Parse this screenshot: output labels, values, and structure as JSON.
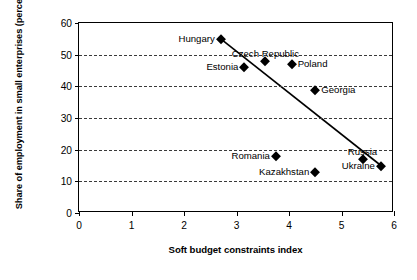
{
  "chart_data": {
    "type": "scatter",
    "title": "",
    "xlabel": "Soft budget constraints index",
    "ylabel": "Share of employment in small enterprises (percent)",
    "xlim": [
      0,
      6
    ],
    "ylim": [
      0,
      60
    ],
    "xticks": [
      "0",
      "1",
      "2",
      "3",
      "4",
      "5",
      "6"
    ],
    "yticks": [
      "0",
      "10",
      "20",
      "30",
      "40",
      "50",
      "60"
    ],
    "grid": "horizontal-dashed",
    "legend": "none",
    "marker_color": "#000000",
    "points": [
      {
        "label": "Hungary",
        "x": 2.7,
        "y": 55,
        "label_pos": "left"
      },
      {
        "label": "Estonia",
        "x": 3.15,
        "y": 46,
        "label_pos": "left"
      },
      {
        "label": "Czech Republic",
        "x": 3.55,
        "y": 48,
        "label_pos": "above"
      },
      {
        "label": "Poland",
        "x": 4.05,
        "y": 47,
        "label_pos": "right"
      },
      {
        "label": "Georgia",
        "x": 4.5,
        "y": 39,
        "label_pos": "right"
      },
      {
        "label": "Romania",
        "x": 3.75,
        "y": 18,
        "label_pos": "left"
      },
      {
        "label": "Kazakhstan",
        "x": 4.5,
        "y": 13,
        "label_pos": "left"
      },
      {
        "label": "Russia",
        "x": 5.4,
        "y": 17,
        "label_pos": "above"
      },
      {
        "label": "Ukraine",
        "x": 5.75,
        "y": 15,
        "label_pos": "left"
      }
    ],
    "trendline": {
      "x0": 2.7,
      "y0": 55,
      "x1": 5.75,
      "y1": 15
    }
  }
}
